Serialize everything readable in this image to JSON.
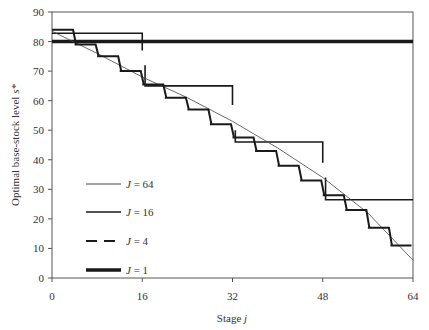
{
  "chart_data": {
    "type": "line",
    "title": "",
    "xlabel": "Stage j",
    "ylabel": "Optimal base-stock level s*",
    "xlim": [
      0,
      64
    ],
    "ylim": [
      0,
      90
    ],
    "xticks": [
      0,
      16,
      32,
      48,
      64
    ],
    "yticks": [
      0,
      10,
      20,
      30,
      40,
      50,
      60,
      70,
      80,
      90
    ],
    "grid": false,
    "legend_position": "inside-left-lower",
    "series": [
      {
        "name": "J = 64",
        "style": "thin",
        "points": [
          [
            0,
            83.5
          ],
          [
            8,
            76
          ],
          [
            16,
            68
          ],
          [
            24,
            61
          ],
          [
            32,
            53
          ],
          [
            40,
            44
          ],
          [
            48,
            34
          ],
          [
            56,
            22
          ],
          [
            64,
            6
          ]
        ]
      },
      {
        "name": "J = 16",
        "style": "medium-step",
        "steps": [
          {
            "from": 0,
            "to": 4,
            "value": 84
          },
          {
            "from": 4,
            "to": 8,
            "value": 79
          },
          {
            "from": 8,
            "to": 12,
            "value": 75
          },
          {
            "from": 12,
            "to": 16,
            "value": 70
          },
          {
            "from": 16,
            "to": 20,
            "value": 65.5
          },
          {
            "from": 20,
            "to": 24,
            "value": 61
          },
          {
            "from": 24,
            "to": 28,
            "value": 57
          },
          {
            "from": 28,
            "to": 32,
            "value": 52
          },
          {
            "from": 32,
            "to": 36,
            "value": 47.5
          },
          {
            "from": 36,
            "to": 40,
            "value": 43
          },
          {
            "from": 40,
            "to": 44,
            "value": 38
          },
          {
            "from": 44,
            "to": 48,
            "value": 33
          },
          {
            "from": 48,
            "to": 52,
            "value": 28
          },
          {
            "from": 52,
            "to": 56,
            "value": 23
          },
          {
            "from": 56,
            "to": 60,
            "value": 17
          },
          {
            "from": 60,
            "to": 64,
            "value": 11
          }
        ]
      },
      {
        "name": "J = 4",
        "style": "dashed-step",
        "steps": [
          {
            "from": 0,
            "to": 16,
            "value": 82.8,
            "end_drop": 77
          },
          {
            "from": 16.5,
            "to": 32,
            "value": 65,
            "start_tick": 72,
            "end_drop": 58.5
          },
          {
            "from": 32.5,
            "to": 48,
            "value": 46,
            "start_tick": 50,
            "end_drop": 39
          },
          {
            "from": 48.5,
            "to": 64,
            "value": 26.5,
            "start_tick": 34
          }
        ]
      },
      {
        "name": "J = 1",
        "style": "thick",
        "steps": [
          {
            "from": 0,
            "to": 64,
            "value": 80
          }
        ]
      }
    ]
  },
  "axes": {
    "x_title_main": "Stage ",
    "x_title_italic": "j",
    "y_title_main": "Optimal base-stock level ",
    "y_title_italic": "s*",
    "x_tick_labels": [
      "0",
      "16",
      "32",
      "48",
      "64"
    ],
    "y_tick_labels": [
      "0",
      "10",
      "20",
      "30",
      "40",
      "50",
      "60",
      "70",
      "80",
      "90"
    ]
  },
  "legend": {
    "items": [
      {
        "label_italic": "J",
        "label_rest": " = 64"
      },
      {
        "label_italic": "J",
        "label_rest": " = 16"
      },
      {
        "label_italic": "J",
        "label_rest": " = 4"
      },
      {
        "label_italic": "J",
        "label_rest": " = 1"
      }
    ]
  },
  "colors": {
    "line": "#1a1a1a",
    "axis": "#555555",
    "text": "#333333"
  }
}
